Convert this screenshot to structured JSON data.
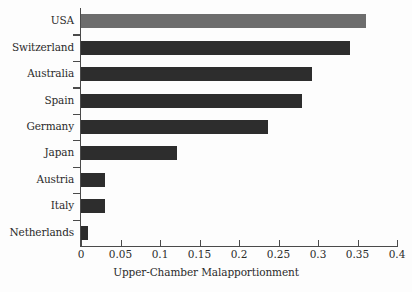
{
  "chart_data": {
    "type": "bar",
    "orientation": "horizontal",
    "title": "",
    "subtitle": "",
    "xlabel": "Upper-Chamber Malapportionment",
    "ylabel": "",
    "categories": [
      "USA",
      "Switzerland",
      "Australia",
      "Spain",
      "Germany",
      "Japan",
      "Austria",
      "Italy",
      "Netherlands"
    ],
    "values": [
      0.361,
      0.341,
      0.292,
      0.28,
      0.237,
      0.121,
      0.03,
      0.03,
      0.009
    ],
    "xlim": [
      0,
      0.4
    ],
    "xticks": [
      0,
      0.05,
      0.1,
      0.15,
      0.2,
      0.25,
      0.3,
      0.35,
      0.4
    ],
    "xtick_labels": [
      "0",
      "0.05",
      "0.1",
      "0.15",
      "0.2",
      "0.25",
      "0.3",
      "0.35",
      "0.4"
    ],
    "grid": false,
    "legend": false,
    "legend_position": "none",
    "bar_colors": [
      "#6d6d6d",
      "#2d2d2d",
      "#2d2d2d",
      "#2d2d2d",
      "#2d2d2d",
      "#2d2d2d",
      "#2d2d2d",
      "#2d2d2d",
      "#2d2d2d"
    ],
    "highlight_category": "USA",
    "annotations": []
  },
  "figure": {
    "background_color": "#fdfdfd",
    "axis_color": "#4a4a4a",
    "text_color": "#2b2b2b"
  }
}
